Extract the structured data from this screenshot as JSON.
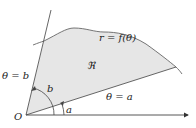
{
  "diagram": {
    "labels": {
      "curve": "r = f(θ)",
      "region": "ℜ",
      "ray_b": "θ = b",
      "ray_a": "θ = a",
      "angle_b": "b",
      "angle_a": "a",
      "origin": "O"
    },
    "colors": {
      "region_fill": "#e6e6e6",
      "stroke": "#555555",
      "text": "#222222"
    }
  }
}
